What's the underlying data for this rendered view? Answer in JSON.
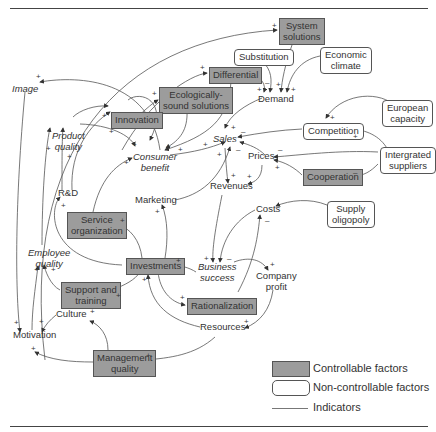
{
  "diagram": {
    "nodes": {
      "system_solutions": "System\nsolutions",
      "substitution": "Substitution",
      "economic_climate": "Economic\nclimate",
      "image": "Image",
      "differential": "Differential",
      "ecological": "Ecologically-\nsound solutions",
      "demand": "Demand",
      "innovation": "Innovation",
      "product_quality": "Product\nquality",
      "sales": "Sales",
      "european_capacity": "European\ncapacity",
      "competition": "Competition",
      "consumer_benefit": "Consumer\nbenefit",
      "prices": "Prices",
      "integrated_suppliers": "Intergrated\nsuppliers",
      "rd": "R&D",
      "revenues": "Revenues",
      "cooperation": "Cooperation",
      "marketing": "Marketing",
      "costs": "Costs",
      "supply_oligopoly": "Supply\noligopoly",
      "service_organization": "Service\norganization",
      "employee_quality": "Employee\nquality",
      "investments": "Investments",
      "business_success": "Business\nsuccess",
      "company_profit": "Company\nprofit",
      "support_training": "Support and\ntraining",
      "rationalization": "Rationalization",
      "culture": "Culture",
      "resources": "Resources",
      "motivation": "Motivation",
      "management_quality": "Management\nquality"
    },
    "signs": {
      "plus": "+",
      "minus": "–"
    }
  },
  "legend": {
    "controllable": "Controllable factors",
    "noncontrollable": "Non-controllable factors",
    "indicators": "Indicators"
  },
  "colors": {
    "controllable_fill": "#9c9c9c",
    "border": "#555555",
    "line": "#555555"
  }
}
